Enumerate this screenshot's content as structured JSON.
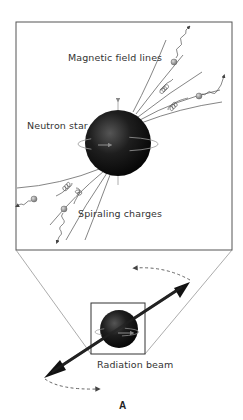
{
  "figure": {
    "panel_label": "A",
    "labels": {
      "magnetic_field_lines": "Magnetic field lines",
      "neutron_star": "Neutron star",
      "spiraling_charges": "Spiraling charges",
      "radiation_beam": "Radiation beam"
    },
    "colors": {
      "star": "#1a1a1a",
      "lines": "#777777",
      "frame": "#555555",
      "charge": "#9a9a9a",
      "beam": "#222222"
    }
  }
}
